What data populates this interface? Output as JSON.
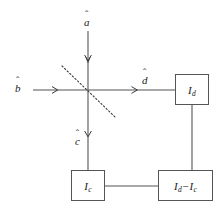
{
  "figure": {
    "type": "optical-beam-splitter-balanced-homodyne-schematic",
    "background_color": "#ffffff",
    "line_color": "#555555",
    "text_color": "#1a1a1a"
  },
  "modes": {
    "input_top": {
      "symbol": "a",
      "accent": "hat",
      "direction": "down"
    },
    "input_left": {
      "symbol": "b",
      "accent": "hat",
      "direction": "right"
    },
    "output_right": {
      "symbol": "d",
      "accent": "hat",
      "direction": "right"
    },
    "output_bottom": {
      "symbol": "c",
      "accent": "hat",
      "direction": "down"
    }
  },
  "beam_splitter": {
    "name": "beam-splitter",
    "style": "dotted-diagonal",
    "orientation": "upper-left-to-lower-right"
  },
  "boxes": {
    "detector_d": {
      "label_main": "I",
      "label_sub": "d"
    },
    "detector_c": {
      "label_main": "I",
      "label_sub": "c"
    },
    "difference": {
      "label_main_1": "I",
      "label_sub_1": "d",
      "operator": "−",
      "label_main_2": "I",
      "label_sub_2": "c"
    }
  },
  "connections": [
    {
      "from": "detector_d",
      "to": "difference",
      "orientation": "vertical"
    },
    {
      "from": "detector_c",
      "to": "difference",
      "orientation": "horizontal"
    },
    {
      "from": "output_bottom",
      "to": "detector_c",
      "orientation": "vertical"
    },
    {
      "from": "output_right",
      "to": "detector_d",
      "orientation": "horizontal"
    }
  ]
}
